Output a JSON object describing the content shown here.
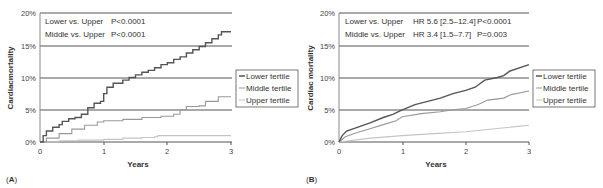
{
  "chart_data": [
    {
      "panel": "A",
      "type": "line",
      "title": "",
      "xlabel": "Years",
      "ylabel": "Cardiacmortality",
      "xlim": [
        0,
        3
      ],
      "ylim": [
        0,
        20
      ],
      "x_ticks": [
        "0",
        "1",
        "2",
        "3"
      ],
      "y_ticks": [
        "0%",
        "5%",
        "10%",
        "15%",
        "20%"
      ],
      "grid": "horizontal",
      "legend_position": "right",
      "annotations": [
        {
          "label": "Lower vs. Upper",
          "stat": "P<0.0001"
        },
        {
          "label": "Middle vs. Upper",
          "stat": "P<0.0001"
        }
      ],
      "series": [
        {
          "name": "Lower tertile",
          "color": "#555555",
          "step": true,
          "points": [
            [
              0,
              0
            ],
            [
              0.05,
              1.0
            ],
            [
              0.1,
              1.7
            ],
            [
              0.2,
              2.3
            ],
            [
              0.3,
              2.7
            ],
            [
              0.35,
              3.2
            ],
            [
              0.45,
              3.6
            ],
            [
              0.55,
              3.8
            ],
            [
              0.65,
              4.3
            ],
            [
              0.75,
              5.3
            ],
            [
              0.85,
              6.0
            ],
            [
              0.95,
              6.3
            ],
            [
              1.0,
              7.5
            ],
            [
              1.05,
              8.5
            ],
            [
              1.15,
              9.1
            ],
            [
              1.3,
              9.6
            ],
            [
              1.4,
              10.0
            ],
            [
              1.5,
              10.4
            ],
            [
              1.6,
              10.8
            ],
            [
              1.7,
              11.1
            ],
            [
              1.8,
              11.5
            ],
            [
              1.9,
              12.0
            ],
            [
              2.0,
              12.3
            ],
            [
              2.1,
              12.8
            ],
            [
              2.2,
              13.2
            ],
            [
              2.3,
              13.8
            ],
            [
              2.4,
              14.3
            ],
            [
              2.5,
              14.8
            ],
            [
              2.6,
              15.4
            ],
            [
              2.7,
              16.0
            ],
            [
              2.8,
              16.6
            ],
            [
              2.85,
              17.1
            ],
            [
              3.0,
              17.1
            ]
          ]
        },
        {
          "name": "Middle tertile",
          "color": "#999999",
          "step": true,
          "points": [
            [
              0,
              0
            ],
            [
              0.1,
              0.6
            ],
            [
              0.3,
              1.3
            ],
            [
              0.5,
              2.0
            ],
            [
              0.7,
              2.6
            ],
            [
              0.9,
              3.1
            ],
            [
              1.0,
              3.3
            ],
            [
              1.3,
              3.5
            ],
            [
              1.6,
              3.8
            ],
            [
              1.9,
              4.0
            ],
            [
              2.1,
              4.3
            ],
            [
              2.2,
              5.0
            ],
            [
              2.3,
              5.5
            ],
            [
              2.5,
              5.6
            ],
            [
              2.6,
              6.3
            ],
            [
              2.8,
              7.0
            ],
            [
              3.0,
              7.0
            ]
          ]
        },
        {
          "name": "Upper tertile",
          "color": "#c4c4c4",
          "step": true,
          "points": [
            [
              0,
              0
            ],
            [
              0.3,
              0.2
            ],
            [
              0.6,
              0.3
            ],
            [
              1.0,
              0.4
            ],
            [
              1.3,
              0.6
            ],
            [
              1.6,
              0.7
            ],
            [
              1.8,
              0.8
            ],
            [
              1.85,
              1.0
            ],
            [
              3.0,
              1.0
            ]
          ]
        }
      ]
    },
    {
      "panel": "B",
      "type": "line",
      "title": "",
      "xlabel": "Years",
      "ylabel": "Cardiac mortality",
      "xlim": [
        0,
        3
      ],
      "ylim": [
        0,
        20
      ],
      "x_ticks": [
        "0",
        "1",
        "2",
        "3"
      ],
      "y_ticks": [
        "0%",
        "5%",
        "10%",
        "15%",
        "20%"
      ],
      "grid": "horizontal",
      "legend_position": "right",
      "annotations": [
        {
          "label": "Lower vs. Upper",
          "hr": "HR 5.6 [2.5–12.4]",
          "stat": "P<0.0001"
        },
        {
          "label": "Middle vs. Upper",
          "hr": "HR 3.4 [1.5–7.7]",
          "stat": "P=0.003"
        }
      ],
      "series": [
        {
          "name": "Lower tertile",
          "color": "#555555",
          "step": false,
          "points": [
            [
              0,
              0
            ],
            [
              0.05,
              1.0
            ],
            [
              0.12,
              1.7
            ],
            [
              0.3,
              2.3
            ],
            [
              0.5,
              3.0
            ],
            [
              0.7,
              3.8
            ],
            [
              0.85,
              4.3
            ],
            [
              1.0,
              5.0
            ],
            [
              1.2,
              5.8
            ],
            [
              1.4,
              6.3
            ],
            [
              1.6,
              6.8
            ],
            [
              1.8,
              7.5
            ],
            [
              2.0,
              8.0
            ],
            [
              2.15,
              8.5
            ],
            [
              2.3,
              9.6
            ],
            [
              2.5,
              10.0
            ],
            [
              2.6,
              10.3
            ],
            [
              2.7,
              11.0
            ],
            [
              3.0,
              12.0
            ]
          ]
        },
        {
          "name": "Middle tertile",
          "color": "#999999",
          "step": false,
          "points": [
            [
              0,
              0
            ],
            [
              0.1,
              0.8
            ],
            [
              0.3,
              1.5
            ],
            [
              0.5,
              2.1
            ],
            [
              0.7,
              2.7
            ],
            [
              0.9,
              3.3
            ],
            [
              1.0,
              3.9
            ],
            [
              1.3,
              4.4
            ],
            [
              1.6,
              4.7
            ],
            [
              1.8,
              5.0
            ],
            [
              2.0,
              5.2
            ],
            [
              2.2,
              5.8
            ],
            [
              2.35,
              6.5
            ],
            [
              2.6,
              6.8
            ],
            [
              2.7,
              7.3
            ],
            [
              3.0,
              7.9
            ]
          ]
        },
        {
          "name": "Upper tertile",
          "color": "#c4c4c4",
          "step": false,
          "points": [
            [
              0,
              0
            ],
            [
              0.5,
              0.6
            ],
            [
              1.0,
              1.0
            ],
            [
              1.5,
              1.3
            ],
            [
              2.0,
              1.6
            ],
            [
              2.5,
              2.1
            ],
            [
              3.0,
              2.6
            ]
          ]
        }
      ]
    }
  ],
  "panels": {
    "a": {
      "label_letter": "A",
      "ylabel": "Cardiacmortality",
      "xlabel": "Years",
      "annotation_1_label": "Lower vs. Upper",
      "annotation_1_stat": "P<0.0001",
      "annotation_2_label": "Middle vs. Upper",
      "annotation_2_stat": "P<0.0001",
      "legend": [
        "Lower tertile",
        "Middle tertile",
        "Upper tertile"
      ]
    },
    "b": {
      "label_letter": "B",
      "ylabel": "Cardiac mortality",
      "xlabel": "Years",
      "annotation_1_label": "Lower vs. Upper",
      "annotation_1_hr": "HR 5.6 [2.5–12.4]",
      "annotation_1_stat": "P<0.0001",
      "annotation_2_label": "Middle vs. Upper",
      "annotation_2_hr": "HR 3.4 [1.5–7.7]",
      "annotation_2_stat": "P=0.003",
      "legend": [
        "Lower tertile",
        "Middle tertile",
        "Upper tertile"
      ]
    }
  },
  "axes": {
    "y_ticks": [
      "0%",
      "5%",
      "10%",
      "15%",
      "20%"
    ],
    "x_ticks": [
      "0",
      "1",
      "2",
      "3"
    ]
  }
}
